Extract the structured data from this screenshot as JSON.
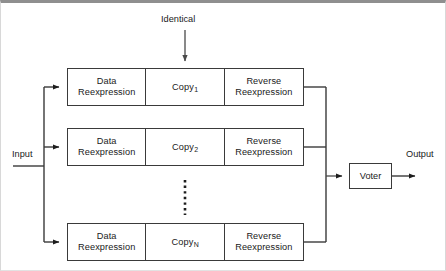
{
  "diagram": {
    "background_color": "#ffffff",
    "line_color": "#3a3a3a",
    "text_color": "#1a1a1a",
    "labels": {
      "identical": "Identical",
      "input": "Input",
      "output": "Output"
    },
    "voter": {
      "label": "Voter"
    },
    "rows": [
      {
        "id": "row-1",
        "data_reexpression": "Data\nReexpression",
        "copy_base": "Copy",
        "copy_subscript": "1",
        "reverse_reexpression": "Reverse\nReexpression"
      },
      {
        "id": "row-2",
        "data_reexpression": "Data\nReexpression",
        "copy_base": "Copy",
        "copy_subscript": "2",
        "reverse_reexpression": "Reverse\nReexpression"
      },
      {
        "id": "row-3",
        "data_reexpression": "Data\nReexpression",
        "copy_base": "Copy",
        "copy_subscript": "N",
        "reverse_reexpression": "Reverse\nReexpression"
      }
    ],
    "ellipsis": {
      "orientation": "vertical",
      "meaning": "additional copies between 2 and N"
    }
  }
}
